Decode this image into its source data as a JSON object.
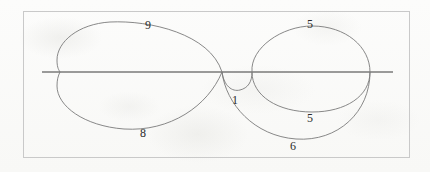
{
  "figure": {
    "type": "plane-curve-diagram",
    "background_color": "#fbfbfa",
    "frame": {
      "stroke": "#c9c9c9",
      "x": 23,
      "y": 11,
      "width": 387,
      "height": 147
    },
    "axis_line": {
      "name": "horizontal-axis",
      "stroke": "#3a3a3a",
      "x1": 42,
      "y1": 72,
      "x2": 393,
      "y2": 72
    },
    "curve_stroke": "#7a7a7a",
    "nodes": [
      {
        "name": "left-cusp",
        "x": 222,
        "y": 72
      },
      {
        "name": "right-node",
        "x": 252,
        "y": 72
      },
      {
        "name": "far-right-node",
        "x": 370,
        "y": 72
      }
    ],
    "arcs": [
      {
        "name": "upper-left-loop",
        "label": "9",
        "label_x": 148,
        "label_y": 25,
        "path": "M 222,72 C 210,34 150,20 110,22 C 78,24 57,42 57,60 C 57,66 58,69 60,72"
      },
      {
        "name": "lower-left-loop",
        "label": "8",
        "label_x": 143,
        "label_y": 133,
        "path": "M 60,72 C 58,76 57,80 57,86 C 57,106 84,126 124,129 C 170,132 208,106 222,72"
      },
      {
        "name": "upper-right-ellipse",
        "label": "5",
        "label_x": 310,
        "label_y": 24,
        "path": "M 252,72 C 250,48 282,26 312,26 C 346,26 370,47 370,72"
      },
      {
        "name": "inner-small-arc",
        "label": "1",
        "label_x": 235,
        "label_y": 100,
        "path": "M 222,72 C 224,86 232,92 240,90 C 248,88 252,82 252,72"
      },
      {
        "name": "lower-right-inner-arc",
        "label": "5",
        "label_x": 310,
        "label_y": 118,
        "path": "M 252,72 C 252,96 278,112 312,112 C 346,112 370,96 370,72"
      },
      {
        "name": "lower-right-outer-arc",
        "label": "6",
        "label_x": 293,
        "label_y": 146,
        "path": "M 222,72 C 226,104 254,136 296,139 C 338,142 370,112 370,72"
      }
    ],
    "labels": [
      {
        "name": "arc-label-9",
        "text": "9",
        "x": 148,
        "y": 25
      },
      {
        "name": "arc-label-5-top",
        "text": "5",
        "x": 310,
        "y": 24
      },
      {
        "name": "arc-label-1",
        "text": "1",
        "x": 235,
        "y": 100
      },
      {
        "name": "arc-label-5-bottom",
        "text": "5",
        "x": 310,
        "y": 118
      },
      {
        "name": "arc-label-8",
        "text": "8",
        "x": 143,
        "y": 133
      },
      {
        "name": "arc-label-6",
        "text": "6",
        "x": 293,
        "y": 146
      }
    ]
  }
}
